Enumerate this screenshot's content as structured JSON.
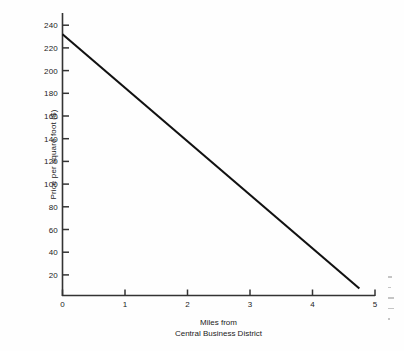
{
  "chart_data": {
    "type": "line",
    "title": "",
    "xlabel": "Miles from Central Business District",
    "xlabel_line1": "Miles from",
    "xlabel_line2": "Central Business District",
    "ylabel": "Price per square foot ($)",
    "xlim": [
      0,
      5
    ],
    "ylim": [
      0,
      250
    ],
    "xticks": [
      0,
      1,
      2,
      3,
      4,
      5
    ],
    "xtick_labels": [
      "0",
      "1",
      "2",
      "3",
      "4",
      "5"
    ],
    "yticks": [
      20,
      40,
      60,
      80,
      100,
      120,
      140,
      160,
      180,
      200,
      220,
      240
    ],
    "ytick_labels": [
      "20",
      "40",
      "60",
      "80",
      "100",
      "120",
      "140",
      "160",
      "180",
      "200",
      "220",
      "240"
    ],
    "grid": false,
    "legend": false,
    "series": [
      {
        "name": "Bid rent",
        "color": "#111111",
        "x": [
          0,
          4.75
        ],
        "values": [
          232,
          8
        ]
      }
    ],
    "line_color": "#111111",
    "axis_color": "#333333",
    "background_color": "#fefefe"
  },
  "axes": {
    "y_axis_name": "y-axis",
    "x_axis_name": "x-axis"
  },
  "artifacts": {
    "note": "faint cut-off marks at right edge"
  }
}
